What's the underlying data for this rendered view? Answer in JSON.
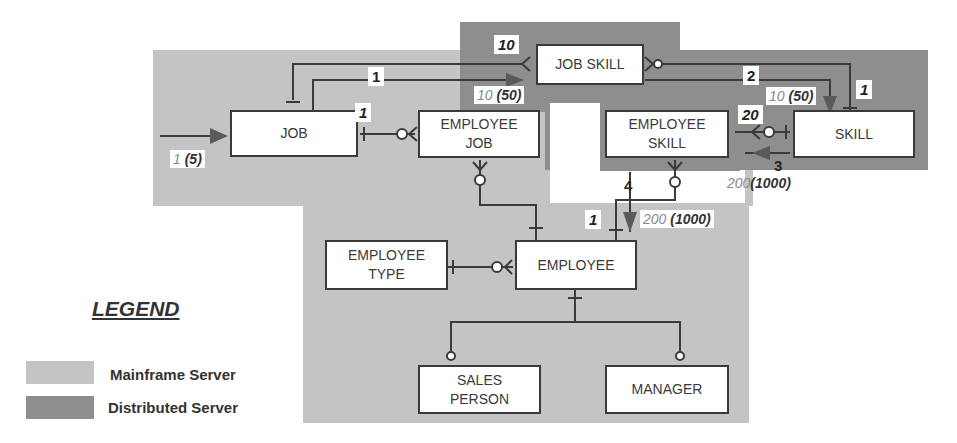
{
  "diagram": {
    "entities": [
      {
        "id": "job",
        "label": "JOB"
      },
      {
        "id": "job_skill",
        "label": "JOB SKILL"
      },
      {
        "id": "skill",
        "label": "SKILL"
      },
      {
        "id": "employee_job",
        "label": "EMPLOYEE JOB"
      },
      {
        "id": "employee_skill",
        "label": "EMPLOYEE SKILL"
      },
      {
        "id": "employee_type",
        "label": "EMPLOYEE TYPE"
      },
      {
        "id": "employee",
        "label": "EMPLOYEE"
      },
      {
        "id": "sales_person",
        "label": "SALES PERSON"
      },
      {
        "id": "manager",
        "label": "MANAGER"
      }
    ],
    "access_steps": [
      {
        "step": "1",
        "label": "1"
      },
      {
        "step": "2",
        "label": "2"
      },
      {
        "step": "3",
        "label": "3"
      },
      {
        "step": "4",
        "label": "4"
      }
    ],
    "counts": {
      "job_entry": {
        "primary": "1",
        "paren": "(5)"
      },
      "job_to_employee_job": "1",
      "job_skill_in": "10",
      "job_skill_vol": {
        "primary": "10",
        "paren": "(50)"
      },
      "skill_vol": {
        "primary": "10",
        "paren": "(50)"
      },
      "skill_in": "1",
      "employee_skill_in": "20",
      "employee_skill_vol": {
        "primary": "200",
        "paren": "(1000)"
      },
      "employee_in": "1",
      "employee_vol": {
        "primary": "200",
        "paren": "(1000)"
      }
    },
    "colors": {
      "mainframe": "#c4c4c4",
      "distributed": "#8e8e8e",
      "line": "#3a3a3a"
    }
  },
  "legend": {
    "title": "LEGEND",
    "items": [
      {
        "label": "Mainframe Server"
      },
      {
        "label": "Distributed Server"
      }
    ]
  }
}
